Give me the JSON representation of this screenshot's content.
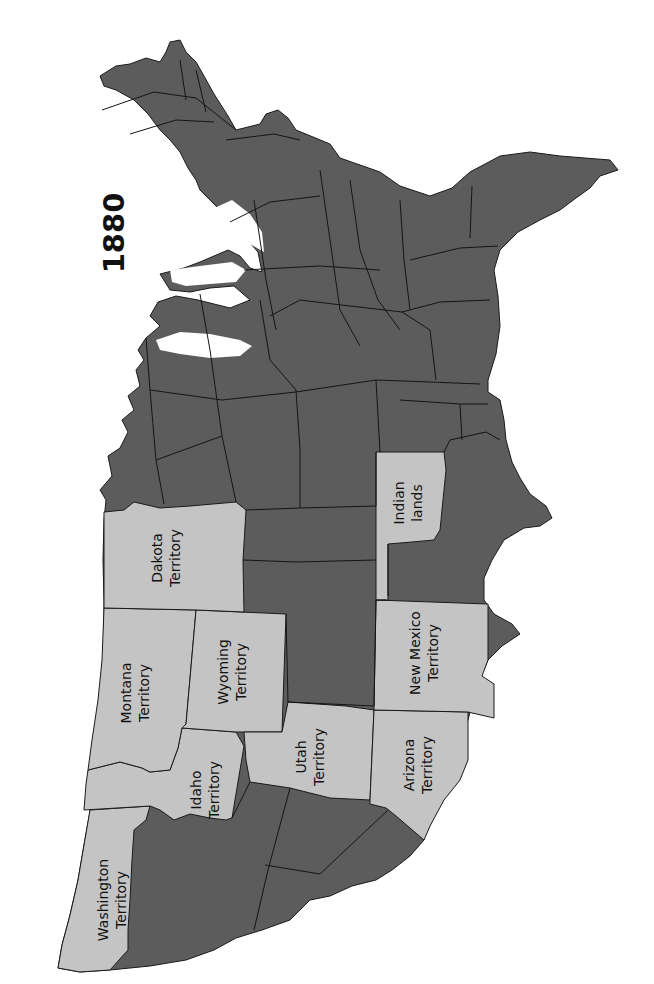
{
  "map": {
    "title": "1880",
    "orientation": "rotated 90 degrees counter-clockwise (north faces left)",
    "colors": {
      "state_fill": "#5c5c5c",
      "territory_fill": "#c4c4c4",
      "border": "#1a1a1a",
      "background": "#ffffff"
    },
    "legend_semantics": {
      "dark_gray": "States",
      "light_gray": "Territories / Indian lands"
    },
    "territories": [
      {
        "id": "washington",
        "line1": "Washington",
        "line2": "Territory"
      },
      {
        "id": "idaho",
        "line1": "Idaho",
        "line2": "Territory"
      },
      {
        "id": "montana",
        "line1": "Montana",
        "line2": "Territory"
      },
      {
        "id": "wyoming",
        "line1": "Wyoming",
        "line2": "Territory"
      },
      {
        "id": "dakota",
        "line1": "Dakota",
        "line2": "Territory"
      },
      {
        "id": "utah",
        "line1": "Utah",
        "line2": "Territory"
      },
      {
        "id": "arizona",
        "line1": "Arizona",
        "line2": "Territory"
      },
      {
        "id": "new-mexico",
        "line1": "New Mexico",
        "line2": "Territory"
      },
      {
        "id": "indian-lands",
        "line1": "Indian",
        "line2": "lands"
      }
    ]
  }
}
